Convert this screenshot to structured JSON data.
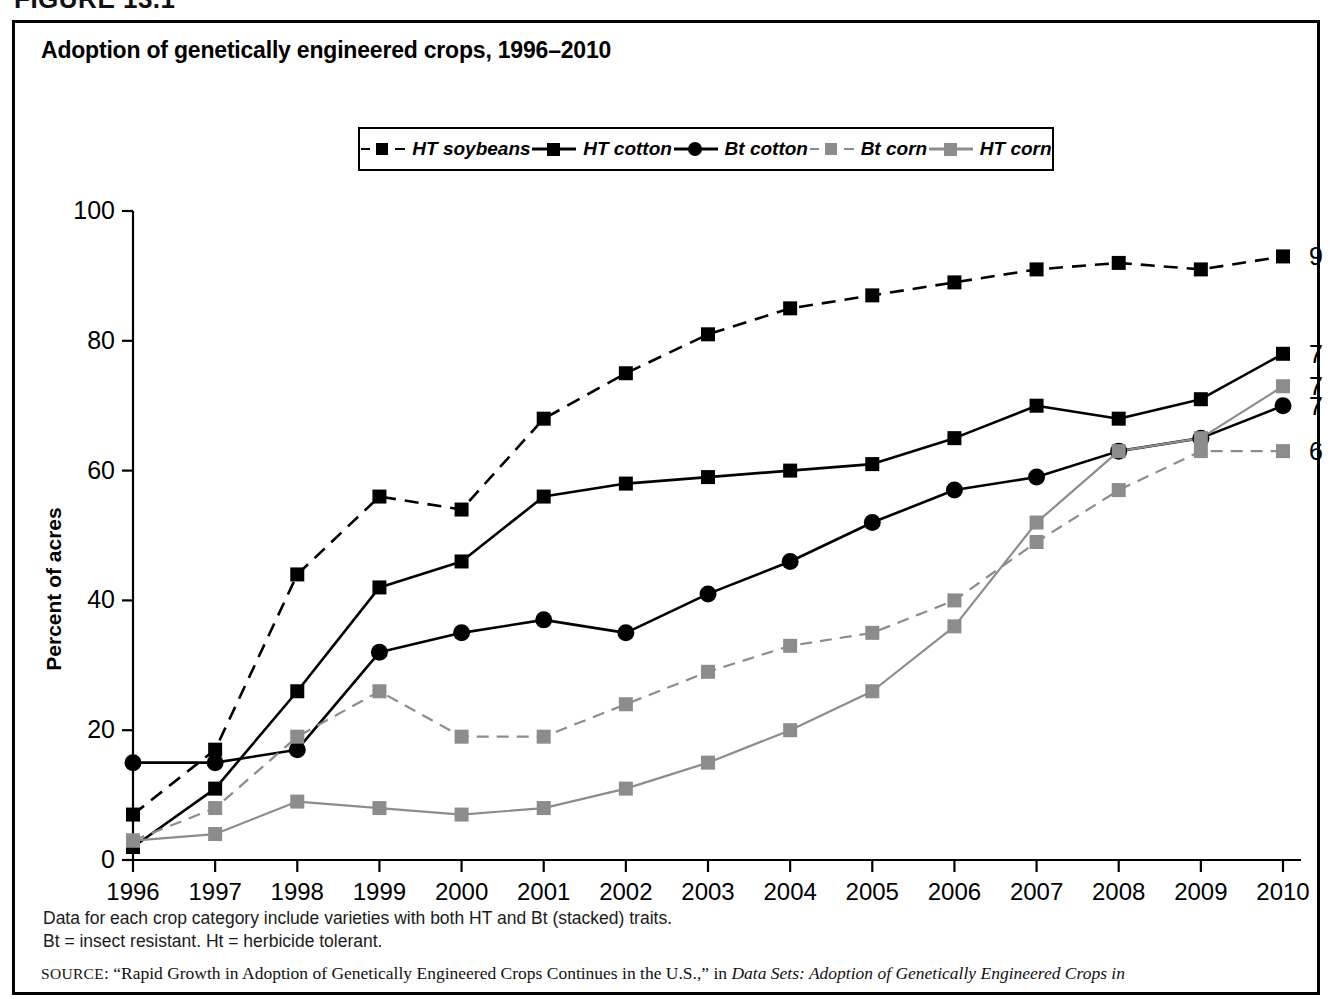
{
  "figure_heading": "FIGURE 13.1",
  "chart_title": "Adoption of genetically engineered crops, 1996–2010",
  "axis": {
    "ylabel": "Percent of acres",
    "yticks": [
      "0",
      "20",
      "40",
      "60",
      "80",
      "100"
    ],
    "xticks": [
      "1996",
      "1997",
      "1998",
      "1999",
      "2000",
      "2001",
      "2002",
      "2003",
      "2004",
      "2005",
      "2006",
      "2007",
      "2008",
      "2009",
      "2010"
    ]
  },
  "legend": {
    "items": [
      {
        "label": "HT soybeans",
        "color": "#000000",
        "dash": "dashed",
        "marker": "square"
      },
      {
        "label": "HT cotton",
        "color": "#000000",
        "dash": "solid",
        "marker": "square"
      },
      {
        "label": "Bt cotton",
        "color": "#000000",
        "dash": "solid",
        "marker": "circle"
      },
      {
        "label": "Bt corn",
        "color": "#8c8c8c",
        "dash": "dashed",
        "marker": "square"
      },
      {
        "label": "HT corn",
        "color": "#8c8c8c",
        "dash": "solid",
        "marker": "square"
      }
    ]
  },
  "end_labels": [
    {
      "series": "HT soybeans",
      "value": "93"
    },
    {
      "series": "HT cotton",
      "value": "78"
    },
    {
      "series": "HT corn",
      "value": "73"
    },
    {
      "series": "Bt cotton",
      "value": "70"
    },
    {
      "series": "Bt corn",
      "value": "63"
    }
  ],
  "notes": [
    "Data for each crop category include varieties with both HT and Bt (stacked) traits.",
    "Bt = insect resistant.  Ht = herbicide tolerant."
  ],
  "source": {
    "prefix": "SOURCE",
    "text_a": ": “Rapid Growth in Adoption of Genetically Engineered Crops Continues in the U.S.,” in ",
    "italic": "Data Sets: Adoption of Genetically Engineered Crops in"
  },
  "chart_data": {
    "type": "line",
    "title": "Adoption of genetically engineered crops, 1996–2010",
    "xlabel": "",
    "ylabel": "Percent of acres",
    "ylim": [
      0,
      100
    ],
    "xlim": [
      1996,
      2010
    ],
    "grid": false,
    "legend_position": "top-center",
    "x": [
      1996,
      1997,
      1998,
      1999,
      2000,
      2001,
      2002,
      2003,
      2004,
      2005,
      2006,
      2007,
      2008,
      2009,
      2010
    ],
    "series": [
      {
        "name": "HT soybeans",
        "color": "#000000",
        "dash": "dashed",
        "marker": "square",
        "values": [
          7,
          17,
          44,
          56,
          54,
          68,
          75,
          81,
          85,
          87,
          89,
          91,
          92,
          91,
          93
        ]
      },
      {
        "name": "HT cotton",
        "color": "#000000",
        "dash": "solid",
        "marker": "square",
        "values": [
          2,
          11,
          26,
          42,
          46,
          56,
          58,
          59,
          60,
          61,
          65,
          70,
          68,
          71,
          78
        ]
      },
      {
        "name": "Bt cotton",
        "color": "#000000",
        "dash": "solid",
        "marker": "circle",
        "values": [
          15,
          15,
          17,
          32,
          35,
          37,
          35,
          41,
          46,
          52,
          57,
          59,
          63,
          65,
          70
        ]
      },
      {
        "name": "Bt corn",
        "color": "#8c8c8c",
        "dash": "dashed",
        "marker": "square",
        "values": [
          3,
          8,
          19,
          26,
          19,
          19,
          24,
          29,
          33,
          35,
          40,
          49,
          57,
          63,
          63
        ]
      },
      {
        "name": "HT corn",
        "color": "#8c8c8c",
        "dash": "solid",
        "marker": "square",
        "values": [
          3,
          4,
          9,
          8,
          7,
          8,
          11,
          15,
          20,
          26,
          36,
          52,
          63,
          65,
          73
        ]
      }
    ]
  }
}
